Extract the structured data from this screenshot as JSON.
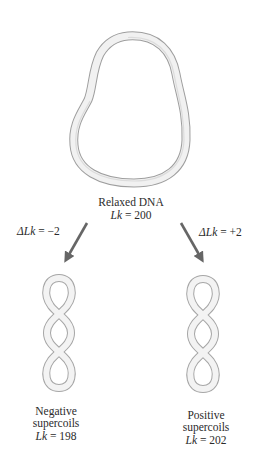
{
  "diagram": {
    "relaxed": {
      "title": "Relaxed DNA",
      "lk_label": "Lk",
      "lk_value": "= 200"
    },
    "transitions": [
      {
        "delta_label": "ΔLk",
        "delta_value": "= −2",
        "direction": "left"
      },
      {
        "delta_label": "ΔLk",
        "delta_value": "= +2",
        "direction": "right"
      }
    ],
    "negative": {
      "line1": "Negative",
      "line2": "supercoils",
      "lk_label": "Lk",
      "lk_value": "= 198"
    },
    "positive": {
      "line1": "Positive",
      "line2": "supercoils",
      "lk_label": "Lk",
      "lk_value": "= 202"
    },
    "colors": {
      "arrow": "#666666",
      "strand_fill": "#f2f2f2",
      "strand_edge": "#a8a8a8"
    }
  }
}
